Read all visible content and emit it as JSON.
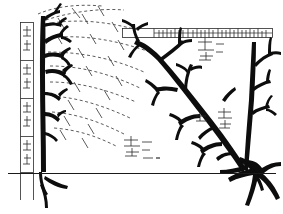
{
  "figure": {
    "title": "Comparative branching diagram of two arborescent structures with measurement scales",
    "caption": "Line drawing: left dark branching form beside a vertical graduated scale, right spreading branching form, dashed radiating lines connecting the two, horizontal graduated scale along the top, ground reference line across the lower third.",
    "background_color": "#ffffff",
    "ink_color": "#0d0d0d",
    "faint_ink_color": "#4a4a4a",
    "width_px": 283,
    "height_px": 214
  },
  "scales": {
    "vertical_ruler": {
      "name": "vertical-scale-bar",
      "orientation": "vertical",
      "x_px": 20,
      "top_px": 22,
      "bottom_px": 172,
      "width_px": 14,
      "segment_count": 4,
      "segment_boundaries_px": [
        22,
        60,
        98,
        136,
        172
      ],
      "tick_label_marks": [
        "—|—",
        "—|—",
        "—|—",
        "—|—"
      ]
    },
    "horizontal_ruler": {
      "name": "horizontal-scale-bar",
      "orientation": "horizontal",
      "y_px": 28,
      "left_px": 122,
      "right_px": 272,
      "height_px": 9,
      "major_tick_count": 5,
      "minor_tick_count": 38,
      "blank_lead_px": 32
    },
    "ground_line": {
      "name": "ground-reference-line",
      "y_px": 173,
      "left_px": 8,
      "right_px": 276
    }
  },
  "structures": [
    {
      "id": "left-structure",
      "label": "left branching form",
      "base_x_px": 44,
      "base_y_px": 173,
      "apex_y_px": 16,
      "trunk_weight": "heavy",
      "branch_tiers": 5,
      "root_spread_px": 34,
      "fill": "#0d0d0d"
    },
    {
      "id": "right-structure",
      "label": "right branching form",
      "base_x_px": 248,
      "base_y_px": 176,
      "apex_y_px": 30,
      "trunk_weight": "heavy",
      "branch_tiers": 7,
      "root_spread_px": 56,
      "fill": "#0d0d0d"
    }
  ],
  "connectors": {
    "name": "dashed-radiating-lines",
    "style": "dashed",
    "count": 9,
    "tick_marks_per_line": 3,
    "origin_region": "left structure branch tips",
    "sweep_region": "upper-left to mid-centre",
    "color": "#4a4a4a"
  },
  "annotations": [
    {
      "id": "ann-1",
      "name": "annotation-upper-right",
      "x_px": 200,
      "y_px": 42,
      "mark": "—┬—",
      "lines": 3
    },
    {
      "id": "ann-2",
      "name": "annotation-mid-right",
      "x_px": 198,
      "y_px": 110,
      "mark": "—┼—",
      "lines": 2
    },
    {
      "id": "ann-3",
      "name": "annotation-lower-centre",
      "x_px": 124,
      "y_px": 138,
      "mark": "—┼—",
      "lines": 3
    },
    {
      "id": "ann-4",
      "name": "annotation-mid-left",
      "x_px": 196,
      "y_px": 114,
      "mark": "—┴—",
      "lines": 2
    }
  ]
}
